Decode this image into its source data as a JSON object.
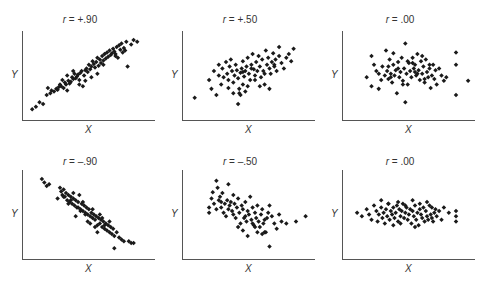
{
  "chart_data": [
    {
      "type": "scatter",
      "title": "r = +.90",
      "r_label": "r",
      "r_value": "+.90",
      "xlabel": "X",
      "ylabel": "Y",
      "grid": false,
      "x": [
        0.06,
        0.09,
        0.12,
        0.15,
        0.18,
        0.19,
        0.21,
        0.22,
        0.24,
        0.26,
        0.27,
        0.28,
        0.29,
        0.3,
        0.31,
        0.32,
        0.33,
        0.34,
        0.35,
        0.36,
        0.37,
        0.38,
        0.39,
        0.4,
        0.41,
        0.42,
        0.43,
        0.44,
        0.45,
        0.46,
        0.47,
        0.48,
        0.49,
        0.5,
        0.51,
        0.52,
        0.53,
        0.54,
        0.55,
        0.56,
        0.57,
        0.58,
        0.59,
        0.6,
        0.61,
        0.62,
        0.63,
        0.64,
        0.65,
        0.66,
        0.67,
        0.68,
        0.69,
        0.7,
        0.71,
        0.72,
        0.73,
        0.74,
        0.75,
        0.76,
        0.77,
        0.78,
        0.79,
        0.8,
        0.81,
        0.82,
        0.83,
        0.84,
        0.85,
        0.88,
        0.9,
        0.93,
        0.35,
        0.45,
        0.55,
        0.65,
        0.75,
        0.5,
        0.4,
        0.6
      ],
      "y": [
        0.12,
        0.15,
        0.2,
        0.18,
        0.28,
        0.36,
        0.3,
        0.33,
        0.32,
        0.35,
        0.34,
        0.37,
        0.4,
        0.38,
        0.45,
        0.36,
        0.42,
        0.4,
        0.5,
        0.44,
        0.41,
        0.43,
        0.48,
        0.46,
        0.52,
        0.47,
        0.49,
        0.51,
        0.45,
        0.53,
        0.55,
        0.38,
        0.5,
        0.56,
        0.58,
        0.54,
        0.62,
        0.57,
        0.6,
        0.66,
        0.63,
        0.59,
        0.65,
        0.7,
        0.61,
        0.68,
        0.64,
        0.72,
        0.67,
        0.74,
        0.69,
        0.76,
        0.71,
        0.78,
        0.73,
        0.75,
        0.8,
        0.77,
        0.74,
        0.82,
        0.7,
        0.84,
        0.79,
        0.86,
        0.76,
        0.81,
        0.78,
        0.88,
        0.6,
        0.85,
        0.9,
        0.88,
        0.33,
        0.4,
        0.48,
        0.62,
        0.72,
        0.44,
        0.55,
        0.52
      ]
    },
    {
      "type": "scatter",
      "title": "r = +.50",
      "r_label": "r",
      "r_value": "+.50",
      "xlabel": "X",
      "ylabel": "Y",
      "grid": false,
      "x": [
        0.08,
        0.2,
        0.22,
        0.24,
        0.26,
        0.28,
        0.28,
        0.3,
        0.31,
        0.32,
        0.34,
        0.35,
        0.36,
        0.37,
        0.38,
        0.39,
        0.4,
        0.41,
        0.42,
        0.43,
        0.44,
        0.45,
        0.45,
        0.46,
        0.47,
        0.48,
        0.48,
        0.49,
        0.5,
        0.51,
        0.52,
        0.53,
        0.54,
        0.55,
        0.56,
        0.57,
        0.58,
        0.59,
        0.6,
        0.61,
        0.62,
        0.63,
        0.64,
        0.65,
        0.66,
        0.67,
        0.68,
        0.69,
        0.7,
        0.71,
        0.72,
        0.73,
        0.74,
        0.75,
        0.76,
        0.78,
        0.8,
        0.82,
        0.84,
        0.86,
        0.88,
        0.9,
        0.44,
        0.46,
        0.5,
        0.52,
        0.4,
        0.36,
        0.58,
        0.62,
        0.66,
        0.7,
        0.74,
        0.78,
        0.55,
        0.48
      ],
      "y": [
        0.25,
        0.45,
        0.35,
        0.55,
        0.28,
        0.5,
        0.62,
        0.4,
        0.58,
        0.48,
        0.65,
        0.52,
        0.45,
        0.6,
        0.68,
        0.55,
        0.42,
        0.5,
        0.62,
        0.56,
        0.47,
        0.35,
        0.3,
        0.53,
        0.58,
        0.4,
        0.66,
        0.49,
        0.55,
        0.6,
        0.7,
        0.52,
        0.45,
        0.62,
        0.74,
        0.57,
        0.5,
        0.65,
        0.55,
        0.72,
        0.6,
        0.48,
        0.68,
        0.55,
        0.4,
        0.78,
        0.62,
        0.7,
        0.58,
        0.52,
        0.65,
        0.75,
        0.6,
        0.68,
        0.55,
        0.72,
        0.64,
        0.58,
        0.7,
        0.74,
        0.66,
        0.8,
        0.18,
        0.28,
        0.32,
        0.38,
        0.3,
        0.36,
        0.45,
        0.38,
        0.52,
        0.35,
        0.62,
        0.82,
        0.58,
        0.54
      ]
    },
    {
      "type": "scatter",
      "title": "r = .00",
      "r_label": "r",
      "r_value": ".00",
      "xlabel": "X",
      "ylabel": "Y",
      "grid": false,
      "x": [
        0.18,
        0.22,
        0.22,
        0.24,
        0.26,
        0.28,
        0.3,
        0.31,
        0.33,
        0.34,
        0.35,
        0.36,
        0.37,
        0.38,
        0.39,
        0.4,
        0.41,
        0.42,
        0.43,
        0.44,
        0.45,
        0.46,
        0.47,
        0.48,
        0.49,
        0.5,
        0.51,
        0.52,
        0.53,
        0.54,
        0.55,
        0.56,
        0.57,
        0.58,
        0.59,
        0.6,
        0.61,
        0.62,
        0.63,
        0.64,
        0.65,
        0.66,
        0.67,
        0.68,
        0.69,
        0.7,
        0.71,
        0.72,
        0.73,
        0.74,
        0.75,
        0.76,
        0.78,
        0.8,
        0.82,
        0.84,
        0.92,
        0.92,
        0.92,
        1.02,
        0.28,
        0.36,
        0.4,
        0.5,
        0.56,
        0.6,
        0.64,
        0.44,
        0.48,
        0.38,
        0.52,
        0.7,
        0.58,
        0.66
      ],
      "y": [
        0.48,
        0.38,
        0.72,
        0.62,
        0.55,
        0.52,
        0.45,
        0.6,
        0.5,
        0.78,
        0.55,
        0.46,
        0.68,
        0.52,
        0.42,
        0.62,
        0.5,
        0.56,
        0.3,
        0.65,
        0.48,
        0.54,
        0.7,
        0.44,
        0.58,
        0.86,
        0.52,
        0.4,
        0.64,
        0.55,
        0.48,
        0.7,
        0.58,
        0.62,
        0.5,
        0.74,
        0.56,
        0.45,
        0.66,
        0.52,
        0.6,
        0.42,
        0.68,
        0.54,
        0.48,
        0.58,
        0.36,
        0.5,
        0.62,
        0.46,
        0.56,
        0.4,
        0.58,
        0.5,
        0.44,
        0.48,
        0.76,
        0.62,
        0.28,
        0.44,
        0.35,
        0.6,
        0.75,
        0.2,
        0.64,
        0.52,
        0.72,
        0.58,
        0.4,
        0.48,
        0.66,
        0.62,
        0.54,
        0.46
      ]
    },
    {
      "type": "scatter",
      "title": "r = -.90",
      "r_label": "r",
      "r_value": "-.90",
      "xlabel": "X",
      "ylabel": "Y",
      "grid": false,
      "x": [
        0.14,
        0.16,
        0.18,
        0.2,
        0.27,
        0.29,
        0.3,
        0.31,
        0.32,
        0.33,
        0.34,
        0.35,
        0.36,
        0.37,
        0.38,
        0.39,
        0.4,
        0.41,
        0.42,
        0.43,
        0.44,
        0.45,
        0.46,
        0.47,
        0.48,
        0.49,
        0.5,
        0.51,
        0.52,
        0.53,
        0.54,
        0.55,
        0.56,
        0.57,
        0.58,
        0.59,
        0.6,
        0.61,
        0.62,
        0.63,
        0.64,
        0.65,
        0.66,
        0.67,
        0.68,
        0.69,
        0.7,
        0.71,
        0.72,
        0.73,
        0.74,
        0.76,
        0.78,
        0.8,
        0.82,
        0.86,
        0.88,
        0.9,
        0.32,
        0.36,
        0.4,
        0.44,
        0.48,
        0.52,
        0.56,
        0.6,
        0.64,
        0.38,
        0.42,
        0.46,
        0.5,
        0.54,
        0.58,
        0.62,
        0.66,
        0.7,
        0.74
      ],
      "y": [
        0.9,
        0.86,
        0.82,
        0.84,
        0.68,
        0.8,
        0.76,
        0.72,
        0.78,
        0.7,
        0.74,
        0.66,
        0.72,
        0.64,
        0.7,
        0.62,
        0.68,
        0.6,
        0.66,
        0.58,
        0.64,
        0.72,
        0.56,
        0.62,
        0.54,
        0.6,
        0.52,
        0.58,
        0.5,
        0.56,
        0.48,
        0.52,
        0.46,
        0.5,
        0.44,
        0.48,
        0.38,
        0.46,
        0.4,
        0.44,
        0.36,
        0.42,
        0.34,
        0.4,
        0.32,
        0.38,
        0.3,
        0.36,
        0.28,
        0.34,
        0.26,
        0.3,
        0.24,
        0.22,
        0.2,
        0.2,
        0.18,
        0.18,
        0.7,
        0.62,
        0.74,
        0.58,
        0.64,
        0.42,
        0.56,
        0.3,
        0.46,
        0.66,
        0.48,
        0.54,
        0.5,
        0.4,
        0.36,
        0.5,
        0.38,
        0.42,
        0.12
      ]
    },
    {
      "type": "scatter",
      "title": "r = -.50",
      "r_label": "r",
      "r_value": "-.50",
      "xlabel": "X",
      "ylabel": "Y",
      "grid": false,
      "x": [
        0.2,
        0.2,
        0.22,
        0.23,
        0.24,
        0.26,
        0.27,
        0.28,
        0.29,
        0.3,
        0.31,
        0.32,
        0.33,
        0.34,
        0.35,
        0.36,
        0.37,
        0.38,
        0.39,
        0.4,
        0.41,
        0.42,
        0.43,
        0.44,
        0.45,
        0.46,
        0.47,
        0.48,
        0.49,
        0.5,
        0.51,
        0.52,
        0.53,
        0.54,
        0.55,
        0.56,
        0.57,
        0.58,
        0.59,
        0.6,
        0.61,
        0.62,
        0.63,
        0.64,
        0.65,
        0.66,
        0.67,
        0.68,
        0.69,
        0.7,
        0.72,
        0.74,
        0.76,
        0.78,
        0.8,
        0.84,
        0.92,
        1.0,
        0.44,
        0.48,
        0.52,
        0.56,
        0.6,
        0.64,
        0.4,
        0.36,
        0.3,
        0.26,
        0.5,
        0.58,
        0.66,
        0.7
      ],
      "y": [
        0.58,
        0.52,
        0.68,
        0.75,
        0.62,
        0.56,
        0.8,
        0.66,
        0.7,
        0.58,
        0.74,
        0.52,
        0.62,
        0.48,
        0.66,
        0.56,
        0.6,
        0.64,
        0.54,
        0.5,
        0.62,
        0.46,
        0.58,
        0.68,
        0.52,
        0.4,
        0.6,
        0.56,
        0.46,
        0.64,
        0.42,
        0.54,
        0.5,
        0.7,
        0.44,
        0.58,
        0.38,
        0.52,
        0.46,
        0.6,
        0.42,
        0.36,
        0.5,
        0.56,
        0.4,
        0.44,
        0.3,
        0.46,
        0.52,
        0.6,
        0.48,
        0.4,
        0.34,
        0.5,
        0.42,
        0.4,
        0.42,
        0.48,
        0.36,
        0.32,
        0.26,
        0.4,
        0.3,
        0.28,
        0.72,
        0.84,
        0.64,
        0.88,
        0.48,
        0.36,
        0.3,
        0.14
      ]
    },
    {
      "type": "scatter",
      "title": "r = .00",
      "r_label": "r",
      "r_value": ".00",
      "xlabel": "X",
      "ylabel": "Y",
      "grid": false,
      "x": [
        0.1,
        0.14,
        0.18,
        0.2,
        0.22,
        0.24,
        0.26,
        0.27,
        0.28,
        0.3,
        0.31,
        0.32,
        0.33,
        0.34,
        0.35,
        0.36,
        0.37,
        0.38,
        0.39,
        0.4,
        0.41,
        0.42,
        0.43,
        0.44,
        0.45,
        0.46,
        0.47,
        0.48,
        0.49,
        0.5,
        0.51,
        0.52,
        0.53,
        0.54,
        0.55,
        0.56,
        0.57,
        0.58,
        0.59,
        0.6,
        0.61,
        0.62,
        0.63,
        0.64,
        0.65,
        0.66,
        0.67,
        0.68,
        0.69,
        0.7,
        0.71,
        0.72,
        0.73,
        0.74,
        0.75,
        0.76,
        0.78,
        0.8,
        0.82,
        0.86,
        0.92,
        0.92,
        0.92,
        0.3,
        0.36,
        0.44,
        0.5,
        0.56,
        0.62,
        0.68,
        0.72,
        0.4,
        0.46,
        0.58
      ],
      "y": [
        0.52,
        0.48,
        0.56,
        0.5,
        0.44,
        0.6,
        0.54,
        0.42,
        0.5,
        0.58,
        0.46,
        0.52,
        0.4,
        0.56,
        0.48,
        0.62,
        0.44,
        0.54,
        0.5,
        0.58,
        0.46,
        0.52,
        0.6,
        0.42,
        0.56,
        0.48,
        0.54,
        0.62,
        0.46,
        0.52,
        0.58,
        0.44,
        0.5,
        0.56,
        0.4,
        0.54,
        0.48,
        0.6,
        0.44,
        0.52,
        0.38,
        0.56,
        0.5,
        0.46,
        0.58,
        0.42,
        0.54,
        0.48,
        0.44,
        0.6,
        0.5,
        0.46,
        0.42,
        0.52,
        0.56,
        0.48,
        0.54,
        0.44,
        0.58,
        0.52,
        0.54,
        0.48,
        0.42,
        0.66,
        0.62,
        0.64,
        0.6,
        0.66,
        0.62,
        0.64,
        0.58,
        0.38,
        0.4,
        0.36
      ]
    }
  ],
  "panels": [
    {
      "r_label": "r",
      "eq": " = +.90",
      "xlabel": "X",
      "ylabel": "Y"
    },
    {
      "r_label": "r",
      "eq": " = +.50",
      "xlabel": "X",
      "ylabel": "Y"
    },
    {
      "r_label": "r",
      "eq": " = .00",
      "xlabel": "X",
      "ylabel": "Y"
    },
    {
      "r_label": "r",
      "eq": " = –.90",
      "xlabel": "X",
      "ylabel": "Y"
    },
    {
      "r_label": "r",
      "eq": " = –.50",
      "xlabel": "X",
      "ylabel": "Y"
    },
    {
      "r_label": "r",
      "eq": " = .00",
      "xlabel": "X",
      "ylabel": "Y"
    }
  ],
  "colors": {
    "axis": "#555555",
    "point": "#1a1a1a",
    "text": "#333333"
  }
}
